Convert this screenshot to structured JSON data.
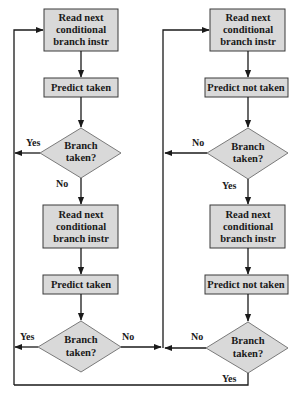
{
  "diagram": {
    "type": "flowchart",
    "colors": {
      "node_fill": "#d9d9d9",
      "node_stroke": "#3a3a3a",
      "line": "#1a1a1a",
      "background": "#ffffff"
    },
    "left": {
      "read1": [
        "Read next",
        "conditional",
        "branch instr"
      ],
      "predict1": "Predict taken",
      "decision1": [
        "Branch",
        "taken?"
      ],
      "decision1_yes": "Yes",
      "decision1_no": "No",
      "read2": [
        "Read next",
        "conditional",
        "branch instr"
      ],
      "predict2": "Predict taken",
      "decision2": [
        "Branch",
        "taken?"
      ],
      "decision2_yes": "Yes",
      "decision2_no": "No"
    },
    "right": {
      "read1": [
        "Read next",
        "conditional",
        "branch instr"
      ],
      "predict1": "Predict not taken",
      "decision1": [
        "Branch",
        "taken?"
      ],
      "decision1_no": "No",
      "decision1_yes": "Yes",
      "read2": [
        "Read next",
        "conditional",
        "branch instr"
      ],
      "predict2": "Predict not taken",
      "decision2": [
        "Branch",
        "taken?"
      ],
      "decision2_no": "No",
      "decision2_yes": "Yes"
    }
  }
}
